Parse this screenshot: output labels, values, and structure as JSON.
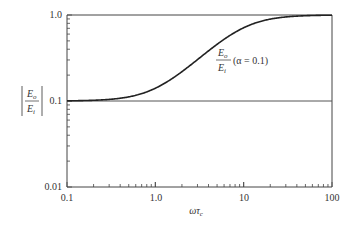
{
  "chart_data": {
    "type": "line",
    "title": "",
    "xlabel": "ωτ_c",
    "ylabel": "|E_o / E_i|",
    "xscale": "log",
    "yscale": "log",
    "xlim": [
      0.1,
      100
    ],
    "ylim": [
      0.01,
      1.0
    ],
    "x_ticks": [
      "0.1",
      "1.0",
      "10",
      "100"
    ],
    "y_ticks": [
      "0.01",
      "0.1",
      "1.0"
    ],
    "grid": false,
    "reference_lines": [
      {
        "y": 0.1
      },
      {
        "y": 1.0
      }
    ],
    "annotation": {
      "fraction_num": "E_o",
      "fraction_den": "E_i",
      "text": "(α = 0.1)"
    },
    "series": [
      {
        "name": "E_o/E_i (α = 0.1)",
        "alpha": 0.1,
        "x": [
          0.1,
          0.2,
          0.3,
          0.5,
          0.7,
          1.0,
          1.5,
          2,
          3,
          5,
          7,
          10,
          15,
          20,
          30,
          50,
          70,
          100
        ],
        "values": [
          0.1,
          0.102,
          0.104,
          0.112,
          0.122,
          0.141,
          0.18,
          0.223,
          0.314,
          0.5,
          0.614,
          0.711,
          0.836,
          0.896,
          0.951,
          0.981,
          0.99,
          0.995
        ]
      }
    ]
  },
  "labels": {
    "y_num": "E",
    "y_num_sub": "o",
    "y_den": "E",
    "y_den_sub": "i",
    "x_main": "ωτ",
    "x_sub": "c",
    "ann_num": "E",
    "ann_num_sub": "o",
    "ann_den": "E",
    "ann_den_sub": "i",
    "ann_text": "(α = 0.1)",
    "xt0": "0.1",
    "xt1": "1.0",
    "xt2": "10",
    "xt3": "100",
    "yt0": "1.0",
    "yt1": "0.1",
    "yt2": "0.01"
  }
}
